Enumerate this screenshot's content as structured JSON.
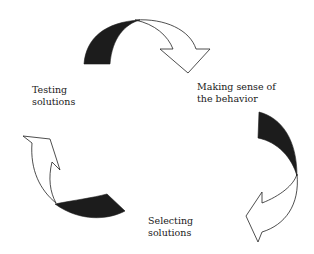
{
  "diagram": {
    "type": "cycle",
    "stages": [
      {
        "id": "testing",
        "lines": [
          "Testing",
          "solutions"
        ]
      },
      {
        "id": "making-sense",
        "lines": [
          "Making sense of",
          "the behavior"
        ]
      },
      {
        "id": "selecting",
        "lines": [
          "Selecting",
          "solutions"
        ]
      }
    ],
    "arrows": [
      {
        "from": "testing",
        "to": "making-sense",
        "style": "curved-clockwise"
      },
      {
        "from": "making-sense",
        "to": "selecting",
        "style": "curved-clockwise"
      },
      {
        "from": "selecting",
        "to": "testing",
        "style": "curved-clockwise"
      }
    ],
    "colors": {
      "arrow_tail": "#1c1c1c",
      "arrow_outline": "#222222",
      "text": "#1a1a1a",
      "background": "#ffffff"
    }
  }
}
